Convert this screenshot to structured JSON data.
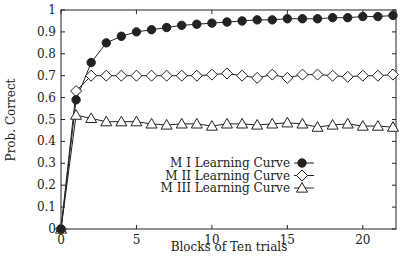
{
  "chart_data": {
    "type": "line",
    "title": "",
    "xlabel": "Blocks of Ten trials",
    "ylabel": "Prob. Correct",
    "xlim": [
      0,
      22.2
    ],
    "ylim": [
      0,
      1
    ],
    "xticks": [
      0,
      5,
      10,
      15,
      20
    ],
    "yticks": [
      0,
      0.1,
      0.2,
      0.3,
      0.4,
      0.5,
      0.6,
      0.7,
      0.8,
      0.9,
      1
    ],
    "ytick_labels": [
      "0",
      "0.1",
      "0.2",
      "0.3",
      "0.4",
      "0.5",
      "0.6",
      "0.7",
      "0.8",
      "0.9",
      "1"
    ],
    "grid": false,
    "legend_position": "center-right",
    "x": [
      0,
      1,
      2,
      3,
      4,
      5,
      6,
      7,
      8,
      9,
      10,
      11,
      12,
      13,
      14,
      15,
      16,
      17,
      18,
      19,
      20,
      21,
      22
    ],
    "series": [
      {
        "name": "M I Learning Curve",
        "marker": "filled-circle",
        "values": [
          0,
          0.59,
          0.76,
          0.85,
          0.88,
          0.9,
          0.91,
          0.92,
          0.93,
          0.935,
          0.94,
          0.945,
          0.95,
          0.955,
          0.955,
          0.96,
          0.96,
          0.96,
          0.965,
          0.965,
          0.97,
          0.97,
          0.975
        ]
      },
      {
        "name": "M II Learning Curve",
        "marker": "open-diamond",
        "values": [
          0,
          0.63,
          0.7,
          0.7,
          0.7,
          0.7,
          0.7,
          0.7,
          0.7,
          0.7,
          0.705,
          0.71,
          0.7,
          0.69,
          0.705,
          0.69,
          0.705,
          0.705,
          0.7,
          0.695,
          0.7,
          0.7,
          0.705
        ]
      },
      {
        "name": "M III Learning Curve",
        "marker": "open-triangle",
        "values": [
          0,
          0.52,
          0.505,
          0.49,
          0.49,
          0.49,
          0.48,
          0.475,
          0.48,
          0.48,
          0.47,
          0.48,
          0.48,
          0.475,
          0.48,
          0.485,
          0.48,
          0.465,
          0.475,
          0.48,
          0.47,
          0.47,
          0.465
        ]
      }
    ]
  },
  "legend": {
    "items": [
      {
        "label": "M I Learning Curve"
      },
      {
        "label": "M II Learning Curve"
      },
      {
        "label": "M III Learning Curve"
      }
    ]
  },
  "axes": {
    "xlabel": "Blocks of Ten trials",
    "ylabel": "Prob. Correct"
  },
  "colors": {
    "line": "#222222",
    "background": "#ffffff"
  }
}
